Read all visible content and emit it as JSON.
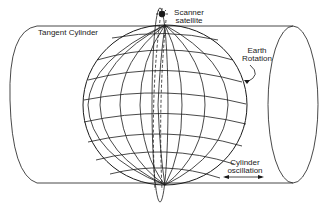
{
  "diagram": {
    "labels": {
      "tangent_cylinder": "Tangent Cylinder",
      "scanner_line1": "Scanner",
      "scanner_line2": "satellite",
      "earth_line1": "Earth",
      "earth_line2": "Rotation",
      "cyl_line1": "Cylinder",
      "cyl_line2": "oscillation"
    },
    "colors": {
      "stroke": "#1a1a1a",
      "background": "#ffffff"
    }
  }
}
